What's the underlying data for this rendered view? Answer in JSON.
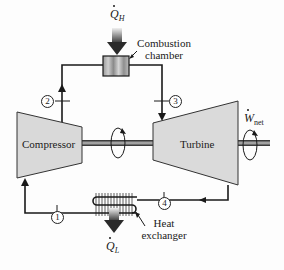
{
  "diagram": {
    "type": "closed-cycle gas turbine (Brayton cycle) schematic",
    "heat_in": {
      "symbol": "Q",
      "subscript": "H"
    },
    "heat_out": {
      "symbol": "Q",
      "subscript": "L"
    },
    "work_out": {
      "symbol": "W",
      "subscript": "net"
    },
    "components": {
      "combustion_chamber": {
        "line1": "Combustion",
        "line2": "chamber"
      },
      "compressor": {
        "label": "Compressor"
      },
      "turbine": {
        "label": "Turbine"
      },
      "heat_exchanger": {
        "line1": "Heat",
        "line2": "exchanger"
      }
    },
    "stations": [
      "1",
      "2",
      "3",
      "4"
    ],
    "colors": {
      "line": "#1a1a1a",
      "component_fill": "#d9d9d9",
      "shaft": "#555555",
      "arrow_gradient_top": "#e8e8e8",
      "arrow_gradient_bottom": "#333333"
    }
  }
}
